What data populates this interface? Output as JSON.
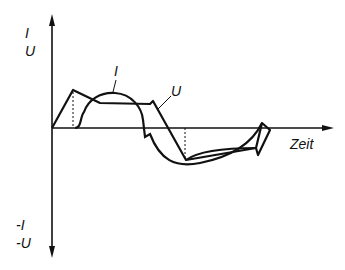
{
  "diagram": {
    "y_axis_top_labels": [
      "I",
      "U"
    ],
    "y_axis_bottom_labels": [
      "-I",
      "-U"
    ],
    "x_axis_label": "Zeit",
    "curve_labels": {
      "current": "I",
      "voltage": "U"
    },
    "line_color": "#111111",
    "background": "#ffffff"
  }
}
